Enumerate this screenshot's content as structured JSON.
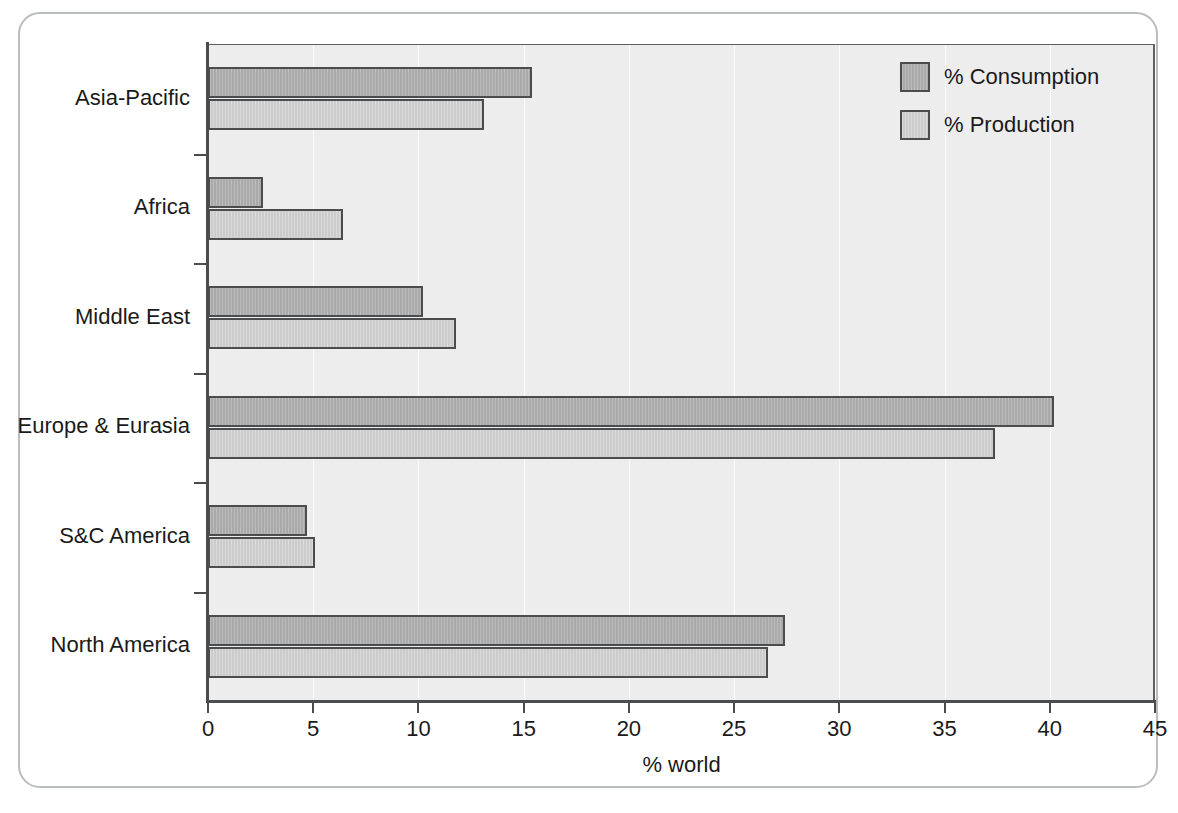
{
  "chart_data": {
    "type": "bar",
    "orientation": "horizontal",
    "title": "",
    "xlabel": "% world",
    "ylabel": "",
    "xlim": [
      0,
      45
    ],
    "xticks": [
      0,
      5,
      10,
      15,
      20,
      25,
      30,
      35,
      40,
      45
    ],
    "xtick_labels": [
      "0",
      "5",
      "10",
      "15",
      "20",
      "25",
      "30",
      "35",
      "40",
      "45"
    ],
    "grid": "vertical-light",
    "legend_position": "top-right",
    "categories": [
      "Asia-Pacific",
      "Africa",
      "Middle East",
      "Europe & Eurasia",
      "S&C America",
      "North America"
    ],
    "series": [
      {
        "name": "% Consumption",
        "color": "#aaaaaa",
        "values": [
          15.4,
          2.6,
          10.2,
          40.2,
          4.7,
          27.4
        ]
      },
      {
        "name": "% Production",
        "color": "#cccccc",
        "values": [
          13.1,
          6.4,
          11.8,
          37.4,
          5.1,
          26.6
        ]
      }
    ]
  },
  "legend": {
    "items": [
      {
        "label": "% Consumption",
        "swatch_class": "consumption"
      },
      {
        "label": "% Production",
        "swatch_class": "production"
      }
    ]
  },
  "axis": {
    "x_title": "% world"
  },
  "colors": {
    "plot_background": "#ededed",
    "figure_background": "#ffffff",
    "frame_border": "#b9bcc0",
    "axis_line": "#4a4c4e",
    "bar_outline": "#4a4c4e",
    "consumption": "#aaaaaa",
    "production": "#cccccc",
    "text": "#1a1a1a"
  }
}
